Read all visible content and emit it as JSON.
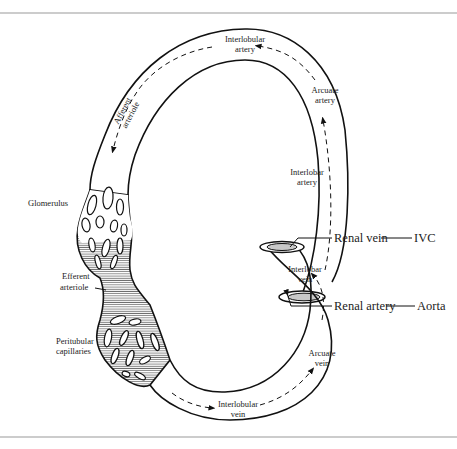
{
  "diagram": {
    "colors": {
      "line": "#111111",
      "hatch": "#333333",
      "rule": "#999999",
      "lumen": "#bbbbbb"
    },
    "labels": {
      "interlobular_artery": [
        "Interlobular",
        "artery"
      ],
      "arcuate_artery": [
        "Arcuate",
        "artery"
      ],
      "interlobar_artery": [
        "Interlobar",
        "artery"
      ],
      "afferent_arteriole": [
        "Afferent",
        "arteriole"
      ],
      "glomerulus": "Glomerulus",
      "efferent_arteriole": [
        "Efferent",
        "arteriole"
      ],
      "peritubular_capillaries": [
        "Peritubular",
        "capillaries"
      ],
      "interlobular_vein": [
        "Interlobular",
        "vein"
      ],
      "arcuate_vein": [
        "Arcuate",
        "vein"
      ],
      "interlobar_vein": [
        "Interlobar",
        "vein"
      ],
      "renal_artery": "Renal artery",
      "aorta": "Aorta",
      "renal_vein": "Renal vein",
      "ivc": "IVC"
    }
  }
}
